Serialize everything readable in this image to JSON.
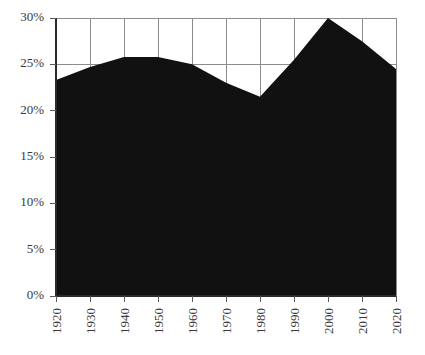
{
  "chart_data": {
    "type": "area",
    "title": "",
    "subtitle": "",
    "xlabel": "",
    "ylabel": "",
    "x": [
      1920,
      1930,
      1940,
      1950,
      1960,
      1970,
      1980,
      1990,
      2000,
      2010,
      2020
    ],
    "categories": [
      "1920",
      "1930",
      "1940",
      "1950",
      "1960",
      "1970",
      "1980",
      "1990",
      "2000",
      "2010",
      "2020"
    ],
    "values": [
      23.3,
      24.7,
      25.8,
      25.8,
      25.0,
      23.0,
      21.5,
      25.5,
      30.0,
      27.5,
      24.5
    ],
    "series": [
      {
        "name": "",
        "values": [
          23.3,
          24.7,
          25.8,
          25.8,
          25.0,
          23.0,
          21.5,
          25.5,
          30.0,
          27.5,
          24.5
        ]
      }
    ],
    "xlim": [
      1920,
      2020
    ],
    "ylim": [
      0,
      30
    ],
    "ytick_values": [
      0,
      5,
      10,
      15,
      20,
      25,
      30
    ],
    "ytick_labels": [
      "0%",
      "5%",
      "10%",
      "15%",
      "20%",
      "25%",
      "30%"
    ],
    "xtick_labels": [
      "1920",
      "1930",
      "1940",
      "1950",
      "1960",
      "1970",
      "1980",
      "1990",
      "2000",
      "2010",
      "2020"
    ],
    "xtick_rotation": 90,
    "grid": true,
    "grid_axis": "both",
    "legend": false,
    "legend_position": "none",
    "annotations": [],
    "colors": {
      "area_fill": "#111111",
      "gridline": "#8c8c8c",
      "axis": "#2b2b2b",
      "tick_text": "#3a3a3a",
      "background": "#ffffff"
    }
  },
  "layout": {
    "plot_left": 56,
    "plot_right": 396,
    "plot_top": 18,
    "plot_bottom": 296,
    "width": 425,
    "height": 355
  }
}
